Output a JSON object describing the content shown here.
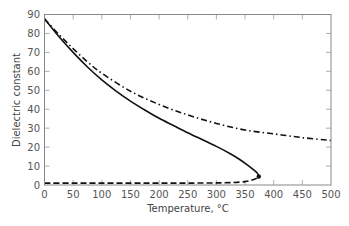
{
  "chart_data": {
    "type": "line",
    "title": "",
    "xlabel": "Temperature, °C",
    "ylabel": "Dielectric constant",
    "xlim": [
      0,
      500
    ],
    "ylim": [
      0,
      90
    ],
    "xticks": [
      0,
      50,
      100,
      150,
      200,
      250,
      300,
      350,
      400,
      450,
      500
    ],
    "yticks": [
      0,
      10,
      20,
      30,
      40,
      50,
      60,
      70,
      80,
      90
    ],
    "grid": false,
    "legend": null,
    "series": [
      {
        "name": "liquid (saturated)",
        "style": "solid",
        "color": "#111111",
        "x": [
          0,
          25,
          50,
          75,
          100,
          125,
          150,
          175,
          200,
          225,
          250,
          275,
          300,
          325,
          340,
          355,
          365,
          372,
          374
        ],
        "y": [
          87.7,
          78.4,
          70.0,
          62.3,
          55.5,
          49.6,
          44.3,
          39.6,
          35.2,
          31.4,
          27.6,
          24.0,
          20.4,
          16.4,
          13.6,
          10.4,
          8.0,
          6.0,
          4.5
        ]
      },
      {
        "name": "vapor (saturated)",
        "style": "dashed",
        "color": "#111111",
        "x": [
          0,
          50,
          100,
          150,
          200,
          250,
          300,
          330,
          350,
          362,
          370,
          374
        ],
        "y": [
          1.0,
          1.0,
          1.0,
          1.0,
          1.0,
          1.0,
          1.1,
          1.3,
          1.8,
          2.6,
          3.5,
          4.5
        ]
      },
      {
        "name": "high-pressure liquid",
        "style": "dashdot",
        "color": "#111111",
        "x": [
          0,
          25,
          50,
          75,
          100,
          150,
          200,
          250,
          300,
          350,
          400,
          450,
          500
        ],
        "y": [
          87.7,
          79.5,
          72.0,
          65.0,
          59.0,
          49.5,
          42.5,
          37.0,
          32.5,
          29.0,
          27.0,
          25.0,
          23.5
        ]
      }
    ]
  }
}
